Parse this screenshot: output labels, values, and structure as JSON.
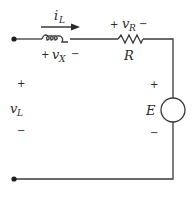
{
  "diagram": {
    "type": "circuit",
    "colors": {
      "line": "#3a3a3a",
      "text": "#2a2a2a",
      "background": "#ffffff"
    },
    "labels": {
      "current": {
        "main": "i",
        "sub": "L"
      },
      "inductor_voltage": {
        "plus": "+",
        "main": "v",
        "sub": "X",
        "minus": "−"
      },
      "resistor_voltage": {
        "plus": "+",
        "main": "v",
        "sub": "R",
        "minus": "−"
      },
      "resistor_name": "R",
      "terminal_voltage": {
        "plus": "+",
        "main": "v",
        "sub": "L",
        "minus": "−"
      },
      "source": {
        "plus": "+",
        "name": "E",
        "minus": "−"
      }
    },
    "components": [
      {
        "id": "inductor",
        "kind": "inductor"
      },
      {
        "id": "resistor",
        "kind": "resistor",
        "label": "R"
      },
      {
        "id": "source",
        "kind": "voltage-source",
        "label": "E"
      },
      {
        "id": "terminal-top",
        "kind": "terminal"
      },
      {
        "id": "terminal-bottom",
        "kind": "terminal"
      }
    ]
  }
}
